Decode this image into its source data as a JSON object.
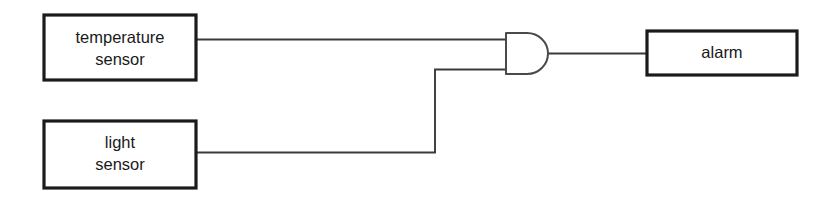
{
  "diagram": {
    "background_color": "#ffffff",
    "line_color": "#3a3a3a",
    "box_border_color": "#1b1b1b",
    "text_color": "#1a1a1a",
    "blocks": [
      {
        "id": "temperature-sensor",
        "label_line1": "temperature",
        "label_line2": "sensor",
        "x": 44,
        "y": 15,
        "width": 152,
        "height": 65
      },
      {
        "id": "light-sensor",
        "label_line1": "light",
        "label_line2": "sensor",
        "x": 44,
        "y": 121,
        "width": 152,
        "height": 67
      },
      {
        "id": "alarm",
        "label_line1": "alarm",
        "label_line2": "",
        "x": 647,
        "y": 31,
        "width": 150,
        "height": 44
      }
    ],
    "gate": {
      "id": "and-gate",
      "type": "AND",
      "label": "AND gate",
      "left_x": 506,
      "top_y": 33,
      "bottom_y": 74,
      "tip_x": 549
    },
    "wires": [
      {
        "id": "temperature-to-gate",
        "from": "temperature-sensor",
        "to": "and-gate",
        "path": "M 196 39.5 L 506 39.5"
      },
      {
        "id": "light-to-gate",
        "from": "light-sensor",
        "to": "and-gate",
        "path": "M 196 152.5 L 435 152.5 L 435 69.5 L 506 69.5"
      },
      {
        "id": "gate-to-alarm",
        "from": "and-gate",
        "to": "alarm",
        "path": "M 549 53.5 L 647 53.5"
      }
    ]
  }
}
